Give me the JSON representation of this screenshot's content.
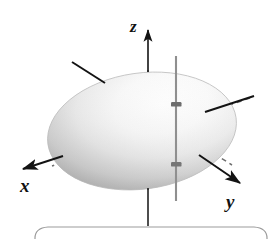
{
  "figure": {
    "background_color": "#ffffff"
  },
  "axes": [
    {
      "id": "x",
      "label": "x",
      "direction": "lower-left",
      "arrow": true,
      "color": "#131313",
      "visible_start": [
        105,
        83
      ],
      "arrow_tip": [
        18,
        168
      ],
      "hidden_dashed": true
    },
    {
      "id": "y",
      "label": "y",
      "direction": "lower-right",
      "arrow": true,
      "color": "#131313",
      "visible_start": [
        252,
        97
      ],
      "arrow_tip": [
        245,
        186
      ],
      "hidden_dashed": true
    },
    {
      "id": "z",
      "label": "z",
      "direction": "up",
      "arrow": true,
      "color": "#131313",
      "arrow_tip": [
        148,
        24
      ],
      "bottom_end": [
        148,
        226
      ],
      "hidden_dashed": true
    }
  ],
  "origin": {
    "x": 142,
    "y": 131
  },
  "ellipsoid": {
    "name": "ellipsoid-surface",
    "center": [
      142,
      131
    ],
    "radius_x": 95,
    "radius_y": 58,
    "rotation_deg": -8,
    "fill_light": "#fdfdfd",
    "fill_mid": "#e2e2e2",
    "fill_dark": "#a9a9a9",
    "edge_color": "#b8b8b8"
  },
  "vertical_line": {
    "name": "vertical-probe-line",
    "label": "",
    "x": 176,
    "top": 56,
    "bottom": 201,
    "color": "#8f8f8f",
    "width": 2
  },
  "intersection_points": [
    {
      "name": "upper-intersection-point",
      "x": 176,
      "y": 105,
      "color": "#6a6a6a"
    },
    {
      "name": "lower-intersection-point",
      "x": 176,
      "y": 165,
      "color": "#6a6a6a"
    }
  ],
  "caption_frame": {
    "name": "caption-panel",
    "visible": true,
    "border_color": "#9b9b9b",
    "top": 228,
    "left": 35,
    "right": 268,
    "radius": 10
  }
}
